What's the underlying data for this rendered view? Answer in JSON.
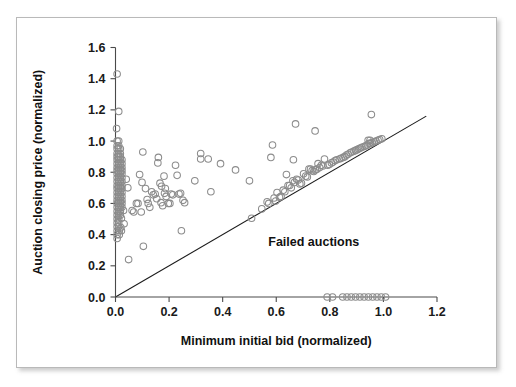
{
  "figure": {
    "background_color": "#ffffff",
    "frame_color": "#b9b9b9",
    "marker_color": "#8c8c8c",
    "axis_color": "#4a4a4a",
    "line_color": "#1b1b1b"
  },
  "chart_data": {
    "type": "scatter",
    "title": "",
    "xlabel": "Minimum initial bid (normalized)",
    "ylabel": "Auction closing price (normalized)",
    "xlim": [
      0.0,
      1.2
    ],
    "ylim": [
      0.0,
      1.6
    ],
    "xticks": [
      0.0,
      0.2,
      0.4,
      0.6,
      0.8,
      1.0,
      1.2
    ],
    "xtick_labels": [
      "0.0",
      "0.2",
      "0.4",
      "0.6",
      "0.8",
      "1.0",
      "1.2"
    ],
    "yticks": [
      0.0,
      0.2,
      0.4,
      0.6,
      0.8,
      1.0,
      1.2,
      1.4,
      1.6
    ],
    "ytick_labels": [
      "0.0",
      "0.2",
      "0.4",
      "0.6",
      "0.8",
      "1.0",
      "1.2",
      "1.4",
      "1.6"
    ],
    "grid": false,
    "legend": null,
    "annotations": [
      {
        "text": "Failed auctions",
        "x": 0.74,
        "y": 0.33
      }
    ],
    "reference_line": {
      "description": "y = x diagonal (closing price equals minimum initial bid)",
      "x": [
        0.0,
        1.16
      ],
      "y": [
        0.0,
        1.16
      ]
    },
    "series": [
      {
        "name": "Auctions",
        "marker": "open-circle",
        "marker_size": 4.6,
        "points": [
          [
            0.006,
            1.43
          ],
          [
            0.012,
            1.19
          ],
          [
            0.004,
            1.08
          ],
          [
            0.006,
            1.0
          ],
          [
            0.012,
            1.0
          ],
          [
            0.006,
            0.97
          ],
          [
            0.012,
            0.97
          ],
          [
            0.006,
            0.95
          ],
          [
            0.012,
            0.95
          ],
          [
            0.018,
            0.95
          ],
          [
            0.006,
            0.92
          ],
          [
            0.012,
            0.92
          ],
          [
            0.018,
            0.92
          ],
          [
            0.006,
            0.9
          ],
          [
            0.012,
            0.9
          ],
          [
            0.018,
            0.9
          ],
          [
            0.006,
            0.88
          ],
          [
            0.012,
            0.88
          ],
          [
            0.018,
            0.88
          ],
          [
            0.024,
            0.88
          ],
          [
            0.006,
            0.855
          ],
          [
            0.012,
            0.855
          ],
          [
            0.018,
            0.855
          ],
          [
            0.024,
            0.855
          ],
          [
            0.006,
            0.83
          ],
          [
            0.012,
            0.83
          ],
          [
            0.018,
            0.83
          ],
          [
            0.024,
            0.83
          ],
          [
            0.006,
            0.81
          ],
          [
            0.012,
            0.81
          ],
          [
            0.018,
            0.81
          ],
          [
            0.024,
            0.81
          ],
          [
            0.006,
            0.79
          ],
          [
            0.012,
            0.79
          ],
          [
            0.018,
            0.79
          ],
          [
            0.024,
            0.79
          ],
          [
            0.006,
            0.765
          ],
          [
            0.012,
            0.765
          ],
          [
            0.018,
            0.765
          ],
          [
            0.024,
            0.765
          ],
          [
            0.006,
            0.74
          ],
          [
            0.012,
            0.74
          ],
          [
            0.018,
            0.74
          ],
          [
            0.024,
            0.74
          ],
          [
            0.006,
            0.715
          ],
          [
            0.012,
            0.715
          ],
          [
            0.018,
            0.715
          ],
          [
            0.024,
            0.715
          ],
          [
            0.006,
            0.695
          ],
          [
            0.012,
            0.695
          ],
          [
            0.018,
            0.695
          ],
          [
            0.024,
            0.695
          ],
          [
            0.006,
            0.67
          ],
          [
            0.012,
            0.67
          ],
          [
            0.018,
            0.67
          ],
          [
            0.024,
            0.67
          ],
          [
            0.006,
            0.645
          ],
          [
            0.012,
            0.645
          ],
          [
            0.018,
            0.645
          ],
          [
            0.024,
            0.645
          ],
          [
            0.006,
            0.62
          ],
          [
            0.012,
            0.62
          ],
          [
            0.018,
            0.62
          ],
          [
            0.024,
            0.62
          ],
          [
            0.006,
            0.6
          ],
          [
            0.012,
            0.6
          ],
          [
            0.018,
            0.6
          ],
          [
            0.024,
            0.6
          ],
          [
            0.006,
            0.575
          ],
          [
            0.012,
            0.575
          ],
          [
            0.018,
            0.575
          ],
          [
            0.024,
            0.575
          ],
          [
            0.006,
            0.55
          ],
          [
            0.012,
            0.55
          ],
          [
            0.018,
            0.55
          ],
          [
            0.03,
            0.555
          ],
          [
            0.006,
            0.525
          ],
          [
            0.012,
            0.525
          ],
          [
            0.018,
            0.525
          ],
          [
            0.006,
            0.5
          ],
          [
            0.012,
            0.5
          ],
          [
            0.022,
            0.505
          ],
          [
            0.006,
            0.475
          ],
          [
            0.012,
            0.475
          ],
          [
            0.032,
            0.47
          ],
          [
            0.006,
            0.45
          ],
          [
            0.012,
            0.45
          ],
          [
            0.02,
            0.445
          ],
          [
            0.006,
            0.425
          ],
          [
            0.014,
            0.425
          ],
          [
            0.022,
            0.425
          ],
          [
            0.006,
            0.4
          ],
          [
            0.014,
            0.4
          ],
          [
            0.006,
            0.375
          ],
          [
            0.04,
            0.755
          ],
          [
            0.046,
            0.7
          ],
          [
            0.049,
            0.24
          ],
          [
            0.062,
            0.555
          ],
          [
            0.068,
            0.545
          ],
          [
            0.078,
            0.6
          ],
          [
            0.084,
            0.6
          ],
          [
            0.09,
            0.785
          ],
          [
            0.096,
            0.545
          ],
          [
            0.102,
            0.93
          ],
          [
            0.099,
            0.735
          ],
          [
            0.104,
            0.325
          ],
          [
            0.112,
            0.695
          ],
          [
            0.118,
            0.625
          ],
          [
            0.122,
            0.6
          ],
          [
            0.128,
            0.575
          ],
          [
            0.135,
            0.675
          ],
          [
            0.141,
            0.655
          ],
          [
            0.148,
            0.66
          ],
          [
            0.154,
            0.63
          ],
          [
            0.16,
            0.895
          ],
          [
            0.158,
            0.86
          ],
          [
            0.166,
            0.73
          ],
          [
            0.172,
            0.71
          ],
          [
            0.17,
            0.605
          ],
          [
            0.176,
            0.585
          ],
          [
            0.181,
            0.775
          ],
          [
            0.186,
            0.695
          ],
          [
            0.183,
            0.665
          ],
          [
            0.189,
            0.645
          ],
          [
            0.197,
            0.6
          ],
          [
            0.203,
            0.6
          ],
          [
            0.208,
            0.66
          ],
          [
            0.214,
            0.655
          ],
          [
            0.224,
            0.845
          ],
          [
            0.23,
            0.78
          ],
          [
            0.237,
            0.66
          ],
          [
            0.243,
            0.665
          ],
          [
            0.246,
            0.425
          ],
          [
            0.252,
            0.62
          ],
          [
            0.258,
            0.605
          ],
          [
            0.296,
            0.745
          ],
          [
            0.318,
            0.92
          ],
          [
            0.318,
            0.885
          ],
          [
            0.346,
            0.885
          ],
          [
            0.356,
            0.675
          ],
          [
            0.392,
            0.855
          ],
          [
            0.448,
            0.815
          ],
          [
            0.5,
            0.745
          ],
          [
            0.508,
            0.505
          ],
          [
            0.546,
            0.565
          ],
          [
            0.566,
            0.61
          ],
          [
            0.572,
            0.6
          ],
          [
            0.58,
            0.895
          ],
          [
            0.586,
            0.975
          ],
          [
            0.592,
            0.635
          ],
          [
            0.598,
            0.615
          ],
          [
            0.603,
            0.67
          ],
          [
            0.612,
            0.64
          ],
          [
            0.618,
            0.645
          ],
          [
            0.626,
            0.685
          ],
          [
            0.632,
            0.675
          ],
          [
            0.638,
            0.785
          ],
          [
            0.644,
            0.715
          ],
          [
            0.65,
            0.715
          ],
          [
            0.656,
            0.7
          ],
          [
            0.662,
            0.745
          ],
          [
            0.668,
            0.735
          ],
          [
            0.664,
            0.88
          ],
          [
            0.672,
            1.11
          ],
          [
            0.676,
            0.755
          ],
          [
            0.682,
            0.75
          ],
          [
            0.688,
            0.725
          ],
          [
            0.694,
            0.73
          ],
          [
            0.702,
            0.79
          ],
          [
            0.71,
            0.775
          ],
          [
            0.716,
            0.77
          ],
          [
            0.722,
            0.82
          ],
          [
            0.728,
            0.82
          ],
          [
            0.734,
            0.81
          ],
          [
            0.74,
            0.805
          ],
          [
            0.746,
            0.815
          ],
          [
            0.752,
            0.82
          ],
          [
            0.745,
            1.065
          ],
          [
            0.756,
            0.855
          ],
          [
            0.762,
            0.83
          ],
          [
            0.768,
            0.845
          ],
          [
            0.774,
            0.84
          ],
          [
            0.78,
            0.885
          ],
          [
            0.792,
            0.845
          ],
          [
            0.798,
            0.85
          ],
          [
            0.806,
            0.86
          ],
          [
            0.812,
            0.865
          ],
          [
            0.82,
            0.875
          ],
          [
            0.826,
            0.88
          ],
          [
            0.836,
            0.885
          ],
          [
            0.842,
            0.89
          ],
          [
            0.85,
            0.895
          ],
          [
            0.856,
            0.9
          ],
          [
            0.862,
            0.91
          ],
          [
            0.868,
            0.915
          ],
          [
            0.876,
            0.925
          ],
          [
            0.882,
            0.93
          ],
          [
            0.89,
            0.935
          ],
          [
            0.896,
            0.94
          ],
          [
            0.902,
            0.945
          ],
          [
            0.908,
            0.95
          ],
          [
            0.914,
            0.955
          ],
          [
            0.92,
            0.96
          ],
          [
            0.928,
            0.965
          ],
          [
            0.934,
            0.97
          ],
          [
            0.94,
            0.975
          ],
          [
            0.946,
            0.985
          ],
          [
            0.952,
            0.985
          ],
          [
            0.958,
            0.99
          ],
          [
            0.943,
            1.005
          ],
          [
            0.95,
            1.005
          ],
          [
            0.966,
            0.995
          ],
          [
            0.972,
            1.0
          ],
          [
            0.98,
            1.005
          ],
          [
            0.986,
            1.01
          ],
          [
            0.994,
            1.015
          ],
          [
            0.955,
            1.17
          ],
          [
            0.79,
            0.0
          ],
          [
            0.81,
            0.0
          ],
          [
            0.848,
            0.0
          ],
          [
            0.864,
            0.0
          ],
          [
            0.88,
            0.0
          ],
          [
            0.896,
            0.0
          ],
          [
            0.912,
            0.0
          ],
          [
            0.928,
            0.0
          ],
          [
            0.944,
            0.0
          ],
          [
            0.96,
            0.0
          ],
          [
            0.976,
            0.0
          ],
          [
            0.992,
            0.0
          ],
          [
            1.008,
            0.0
          ]
        ]
      }
    ]
  }
}
